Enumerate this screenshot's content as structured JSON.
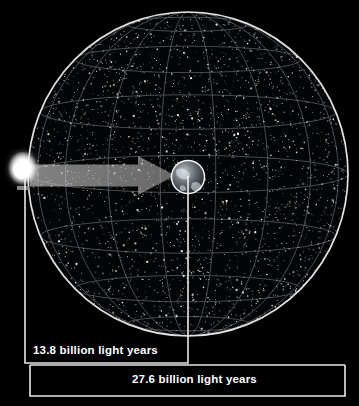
{
  "figure": {
    "background_color": "#000000",
    "title_visible": false
  },
  "chart_data": {
    "type": "diagram",
    "title": "",
    "annotations": [
      {
        "name": "radius",
        "value": 13.8,
        "unit": "billion light years",
        "label": "13.8 billion light years"
      },
      {
        "name": "diameter",
        "value": 27.6,
        "unit": "billion light years",
        "label": "27.6 billion light years"
      }
    ]
  },
  "scene": {
    "sphere": {
      "name": "observable-universe-sphere",
      "center_x": 188,
      "center_y": 174,
      "radius_x": 160,
      "radius_y": 162,
      "outline_color": "#f2f2f2",
      "grid_color": "#9aa0a8",
      "latitude_count": 7,
      "longitude_count": 9,
      "starfield_color": "#ffffff"
    },
    "light_source": {
      "name": "big-bang-light-source",
      "x": 23,
      "y": 173,
      "glow_color": "#ffffff"
    },
    "arrow": {
      "name": "light-travel-arrow",
      "from_x": 30,
      "to_x": 175,
      "y": 175,
      "color": "#b9b9b9"
    },
    "earth": {
      "name": "earth-marker",
      "x": 188,
      "y": 177,
      "radius": 17,
      "outline_color": "#ffffff"
    }
  },
  "measurements": {
    "radius_bracket": {
      "name": "radius-bracket",
      "left_x": 25,
      "right_x": 188,
      "top_y": 175,
      "bottom_y": 363,
      "color": "#f5f5f5"
    },
    "diameter_bracket": {
      "name": "diameter-bracket",
      "left_x": 30,
      "right_x": 345,
      "top_y": 365,
      "bottom_y": 396,
      "color": "#f5f5f5"
    }
  },
  "labels": {
    "radius": "13.8 billion light years",
    "diameter": "27.6 billion light years"
  }
}
